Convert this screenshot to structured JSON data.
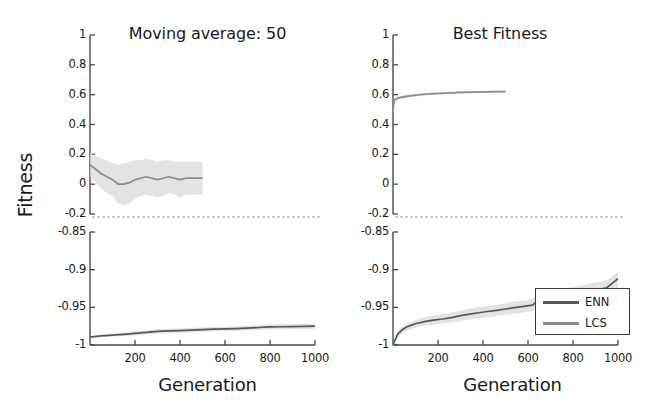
{
  "figure": {
    "ylabel": "Fitness",
    "xlabel_left": "Generation",
    "xlabel_right": "Generation"
  },
  "panels": [
    {
      "title": "Moving average: 50"
    },
    {
      "title": "Best Fitness"
    }
  ],
  "legend": {
    "entries": [
      {
        "label": "ENN",
        "color": "#595959"
      },
      {
        "label": "LCS",
        "color": "#8c8c8c"
      }
    ]
  },
  "axes": {
    "x_ticks": [
      "200",
      "400",
      "600",
      "800",
      "1000"
    ],
    "y_ticks_upper": [
      "1",
      "0.8",
      "0.6",
      "0.4",
      "0.2",
      "0",
      "-0.2"
    ],
    "y_ticks_lower": [
      "-0.85",
      "-0.9",
      "-0.95",
      "-1"
    ]
  },
  "chart_data": {
    "type": "line",
    "xlabel": "Generation",
    "ylabel": "Fitness",
    "xlim": [
      0,
      1000
    ],
    "grid": false,
    "legend_position": "lower-right of right panel bottom sub-axis",
    "broken_axis": {
      "upper_ylim": [
        -0.2,
        1
      ],
      "lower_ylim": [
        -1,
        -0.85
      ],
      "upper_yticks": [
        1,
        0.8,
        0.6,
        0.4,
        0.2,
        0,
        -0.2
      ],
      "lower_yticks": [
        -0.85,
        -0.9,
        -0.95,
        -1
      ]
    },
    "panels": [
      {
        "title": "Moving average: 50",
        "series": [
          {
            "name": "LCS",
            "axis": "upper",
            "color": "#8c8c8c",
            "band_color": "#d9d9d9",
            "x": [
              0,
              25,
              50,
              75,
              100,
              125,
              150,
              175,
              200,
              225,
              250,
              275,
              300,
              325,
              350,
              375,
              400,
              425,
              450,
              475,
              500
            ],
            "y": [
              0.13,
              0.1,
              0.07,
              0.05,
              0.03,
              0.0,
              0.0,
              0.01,
              0.03,
              0.04,
              0.05,
              0.04,
              0.03,
              0.04,
              0.05,
              0.04,
              0.03,
              0.04,
              0.04,
              0.04,
              0.04
            ],
            "y_upper": [
              0.21,
              0.19,
              0.17,
              0.16,
              0.14,
              0.13,
              0.14,
              0.15,
              0.16,
              0.16,
              0.17,
              0.16,
              0.15,
              0.16,
              0.16,
              0.15,
              0.15,
              0.15,
              0.15,
              0.15,
              0.15
            ],
            "y_lower": [
              0.05,
              0.01,
              -0.03,
              -0.06,
              -0.08,
              -0.13,
              -0.14,
              -0.13,
              -0.1,
              -0.08,
              -0.07,
              -0.08,
              -0.09,
              -0.08,
              -0.06,
              -0.07,
              -0.09,
              -0.07,
              -0.07,
              -0.07,
              -0.07
            ]
          },
          {
            "name": "ENN",
            "axis": "lower",
            "color": "#595959",
            "band_color": "#d9d9d9",
            "x": [
              0,
              50,
              100,
              150,
              200,
              250,
              300,
              350,
              400,
              450,
              500,
              550,
              600,
              650,
              700,
              750,
              800,
              850,
              900,
              950,
              1000
            ],
            "y": [
              -0.9895,
              -0.988,
              -0.9868,
              -0.9858,
              -0.9846,
              -0.9832,
              -0.9818,
              -0.9812,
              -0.9808,
              -0.9802,
              -0.9796,
              -0.979,
              -0.9786,
              -0.9782,
              -0.9776,
              -0.9768,
              -0.976,
              -0.9758,
              -0.9756,
              -0.9752,
              -0.975
            ],
            "y_upper": [
              -0.988,
              -0.9862,
              -0.9848,
              -0.9836,
              -0.9822,
              -0.9806,
              -0.979,
              -0.9784,
              -0.978,
              -0.9774,
              -0.9768,
              -0.9762,
              -0.9757,
              -0.9752,
              -0.9745,
              -0.9736,
              -0.9727,
              -0.9725,
              -0.9722,
              -0.9718,
              -0.9716
            ],
            "y_lower": [
              -0.991,
              -0.9898,
              -0.9888,
              -0.988,
              -0.987,
              -0.9858,
              -0.9846,
              -0.984,
              -0.9836,
              -0.983,
              -0.9824,
              -0.9818,
              -0.9815,
              -0.9812,
              -0.9807,
              -0.98,
              -0.9793,
              -0.9791,
              -0.979,
              -0.9786,
              -0.9784
            ]
          }
        ]
      },
      {
        "title": "Best Fitness",
        "series": [
          {
            "name": "LCS",
            "axis": "upper",
            "color": "#8c8c8c",
            "band_color": "#d9d9d9",
            "x": [
              0,
              5,
              10,
              20,
              40,
              60,
              90,
              130,
              180,
              240,
              300,
              360,
              420,
              460,
              500
            ],
            "y": [
              0.5,
              0.555,
              0.568,
              0.576,
              0.583,
              0.589,
              0.595,
              0.601,
              0.607,
              0.611,
              0.615,
              0.617,
              0.619,
              0.62,
              0.621
            ],
            "y_upper": [
              0.545,
              0.572,
              0.582,
              0.589,
              0.595,
              0.6,
              0.605,
              0.61,
              0.615,
              0.618,
              0.621,
              0.623,
              0.625,
              0.626,
              0.627
            ],
            "y_lower": [
              0.455,
              0.538,
              0.554,
              0.563,
              0.571,
              0.578,
              0.585,
              0.592,
              0.599,
              0.604,
              0.609,
              0.611,
              0.613,
              0.614,
              0.615
            ]
          },
          {
            "name": "ENN",
            "axis": "lower",
            "color": "#595959",
            "band_color": "#d9d9d9",
            "x": [
              0,
              20,
              40,
              60,
              80,
              100,
              140,
              180,
              220,
              260,
              300,
              340,
              380,
              420,
              460,
              500,
              540,
              580,
              620,
              640,
              660,
              700,
              750,
              800,
              850,
              900,
              950,
              1000
            ],
            "y": [
              -1.0,
              -0.986,
              -0.98,
              -0.9762,
              -0.974,
              -0.9718,
              -0.969,
              -0.967,
              -0.9655,
              -0.9636,
              -0.961,
              -0.959,
              -0.9572,
              -0.9555,
              -0.954,
              -0.9522,
              -0.9505,
              -0.9488,
              -0.947,
              -0.942,
              -0.94,
              -0.938,
              -0.9355,
              -0.933,
              -0.93,
              -0.927,
              -0.924,
              -0.912
            ],
            "y_upper": [
              -0.998,
              -0.982,
              -0.9755,
              -0.9715,
              -0.969,
              -0.9665,
              -0.9632,
              -0.961,
              -0.9592,
              -0.957,
              -0.9542,
              -0.952,
              -0.95,
              -0.9482,
              -0.9465,
              -0.9445,
              -0.9426,
              -0.9408,
              -0.9388,
              -0.933,
              -0.9305,
              -0.9282,
              -0.9255,
              -0.923,
              -0.92,
              -0.917,
              -0.914,
              -0.903
            ],
            "y_lower": [
              -1.0,
              -0.99,
              -0.9845,
              -0.981,
              -0.979,
              -0.977,
              -0.9745,
              -0.9728,
              -0.9715,
              -0.97,
              -0.9678,
              -0.966,
              -0.9644,
              -0.9628,
              -0.9615,
              -0.9598,
              -0.9584,
              -0.9568,
              -0.9552,
              -0.951,
              -0.9495,
              -0.9478,
              -0.9455,
              -0.9432,
              -0.9404,
              -0.9375,
              -0.9345,
              -0.925
            ]
          }
        ]
      }
    ]
  }
}
